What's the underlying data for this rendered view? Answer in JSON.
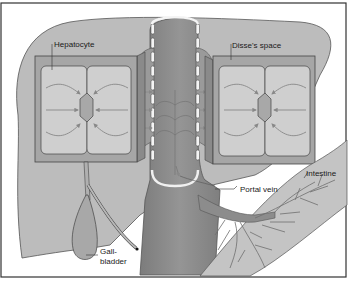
{
  "diagram": {
    "type": "anatomy-illustration",
    "labels": {
      "hepatocyte": "Hepatocyte",
      "disse_space": "Disse's space",
      "portal_vein": "Portal vein",
      "intestine": "Intestine",
      "gallbladder_line1": "Gall-",
      "gallbladder_line2": "bladder"
    },
    "colors": {
      "liver": "#b9b9b9",
      "box_outer": "#a3a3a3",
      "cell": "#cfcfcf",
      "canaliculus": "#a8a8a8",
      "vessel": "#8e8e8e",
      "vessel_dark": "#7a7a7a",
      "intestine": "#c4c4c4",
      "veins": "#6f6f6f",
      "outline": "#3c3c3c",
      "arrow": "#888888"
    }
  }
}
